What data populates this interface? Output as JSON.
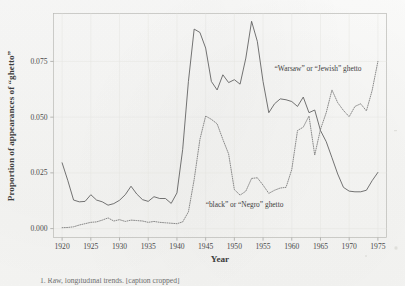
{
  "figure": {
    "background_color": "#f8f8f7",
    "line_color_solid": "#5b5b5b",
    "line_color_dotted": "#767676",
    "caption": "1. Raw, longitudinal trends. [caption cropped]"
  },
  "chart_data": {
    "type": "line",
    "title": "",
    "xlabel": "Year",
    "ylabel": "Proportion of appearances of “ghetto”",
    "xlim": [
      1918.5,
      1976.5
    ],
    "ylim": [
      -0.004,
      0.0965
    ],
    "xticks": [
      1920,
      1925,
      1930,
      1935,
      1940,
      1945,
      1950,
      1955,
      1960,
      1965,
      1970,
      1975
    ],
    "xtick_labels": [
      "1920",
      "1925",
      "1930",
      "1935",
      "1940",
      "1945",
      "1950",
      "1955",
      "1960",
      "1965",
      "1970",
      "1975"
    ],
    "yticks": [
      0.0,
      0.025,
      0.05,
      0.075
    ],
    "ytick_labels": [
      "0.000",
      "0.025",
      "0.050",
      "0.075"
    ],
    "grid": true,
    "legend": "inline-annotations",
    "annotations": [
      {
        "id": "warsaw-jewish",
        "text": "“Warsaw” or “Jewish” ghetto",
        "x": 1957.0,
        "y": 0.0705,
        "anchor": "start"
      },
      {
        "id": "black-negro",
        "text": "“black” or “Negro” ghetto",
        "x": 1945.0,
        "y": 0.0095,
        "anchor": "start"
      }
    ],
    "x": [
      1920,
      1921,
      1922,
      1923,
      1924,
      1925,
      1926,
      1927,
      1928,
      1929,
      1930,
      1931,
      1932,
      1933,
      1934,
      1935,
      1936,
      1937,
      1938,
      1939,
      1940,
      1941,
      1942,
      1943,
      1944,
      1945,
      1946,
      1947,
      1948,
      1949,
      1950,
      1951,
      1952,
      1953,
      1954,
      1955,
      1956,
      1957,
      1958,
      1959,
      1960,
      1961,
      1962,
      1963,
      1964,
      1965,
      1966,
      1967,
      1968,
      1969,
      1970,
      1971,
      1972,
      1973,
      1974,
      1975
    ],
    "series": [
      {
        "name": "“Warsaw” or “Jewish” ghetto",
        "style": "solid",
        "values": [
          0.0295,
          0.0215,
          0.0128,
          0.012,
          0.0122,
          0.0152,
          0.0128,
          0.012,
          0.0105,
          0.0112,
          0.0127,
          0.0152,
          0.019,
          0.0155,
          0.013,
          0.0122,
          0.0143,
          0.0135,
          0.0135,
          0.0113,
          0.016,
          0.0355,
          0.066,
          0.0895,
          0.088,
          0.081,
          0.066,
          0.0622,
          0.069,
          0.0655,
          0.0668,
          0.0648,
          0.0765,
          0.093,
          0.084,
          0.066,
          0.052,
          0.056,
          0.0582,
          0.0578,
          0.057,
          0.0548,
          0.059,
          0.052,
          0.0532,
          0.044,
          0.039,
          0.0318,
          0.0245,
          0.0185,
          0.0168,
          0.0165,
          0.0165,
          0.0172,
          0.0215,
          0.0252
        ]
      },
      {
        "name": "“black” or “Negro” ghetto",
        "style": "dotted",
        "values": [
          0.0004,
          0.0005,
          0.0008,
          0.0016,
          0.0022,
          0.0028,
          0.003,
          0.0038,
          0.0048,
          0.0034,
          0.004,
          0.0032,
          0.0038,
          0.0036,
          0.0034,
          0.0028,
          0.0032,
          0.0028,
          0.0026,
          0.0024,
          0.0022,
          0.003,
          0.0075,
          0.022,
          0.04,
          0.0505,
          0.049,
          0.047,
          0.04,
          0.0335,
          0.0175,
          0.015,
          0.0168,
          0.0225,
          0.0228,
          0.0195,
          0.0158,
          0.0172,
          0.0182,
          0.0185,
          0.0265,
          0.044,
          0.0455,
          0.0505,
          0.033,
          0.0445,
          0.052,
          0.0622,
          0.0565,
          0.053,
          0.0502,
          0.0548,
          0.056,
          0.0528,
          0.062,
          0.075
        ]
      }
    ]
  }
}
